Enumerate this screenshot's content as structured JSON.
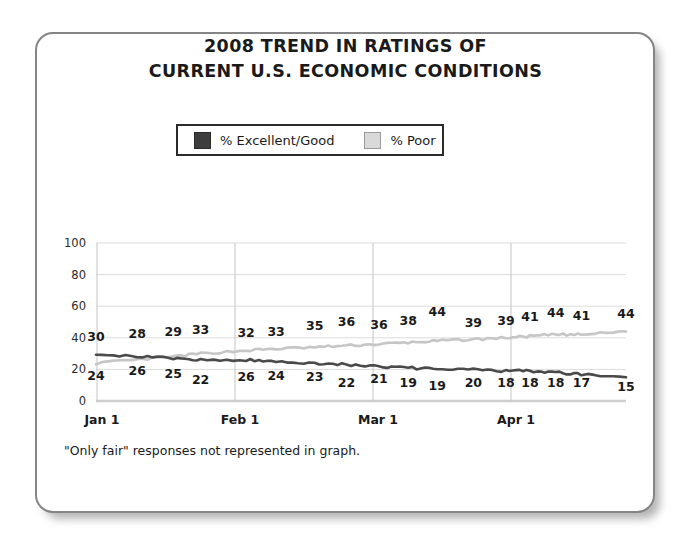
{
  "card": {
    "title_line1": "2008 TREND IN RATINGS OF",
    "title_line2": "CURRENT U.S. ECONOMIC CONDITIONS",
    "footnote": "\"Only fair\" responses not represented in graph."
  },
  "legend": {
    "entries": [
      {
        "label": "% Excellent/Good",
        "color": "#3d3d3d",
        "swatch": "dark"
      },
      {
        "label": "% Poor",
        "color": "#d9d9d9",
        "swatch": "light"
      }
    ]
  },
  "chart_data": {
    "type": "line",
    "title": "2008 TREND IN RATINGS OF CURRENT U.S. ECONOMIC CONDITIONS",
    "xlabel": "",
    "ylabel": "",
    "ylim": [
      0,
      100
    ],
    "yticks": [
      0,
      20,
      40,
      60,
      80,
      100
    ],
    "xticks": [
      "Jan 1",
      "Feb 1",
      "Mar 1",
      "Apr 1"
    ],
    "grid": true,
    "legend_position": "top-center",
    "note": "\"Only fair\" responses not represented in graph.",
    "series": [
      {
        "name": "% Excellent/Good",
        "color": "#4a4a4a",
        "values": [
          30,
          28,
          29,
          33,
          32,
          33,
          35,
          36,
          36,
          38,
          44,
          39,
          39,
          41,
          44,
          41,
          44
        ],
        "label_positions": [
          {
            "x": 30,
            "y": 30,
            "text": "30"
          },
          {
            "x": 78,
            "y": 28,
            "text": "28"
          },
          {
            "x": 120,
            "y": 29,
            "text": "29"
          },
          {
            "x": 152,
            "y": 33,
            "text": "33"
          },
          {
            "x": 205,
            "y": 32,
            "text": "32"
          },
          {
            "x": 240,
            "y": 33,
            "text": "33"
          },
          {
            "x": 285,
            "y": 35,
            "text": "35"
          },
          {
            "x": 322,
            "y": 36,
            "text": "36"
          },
          {
            "x": 360,
            "y": 36,
            "text": "36"
          },
          {
            "x": 394,
            "y": 38,
            "text": "38"
          },
          {
            "x": 428,
            "y": 44,
            "text": "44"
          },
          {
            "x": 470,
            "y": 39,
            "text": "39"
          },
          {
            "x": 508,
            "y": 39,
            "text": "39"
          },
          {
            "x": 536,
            "y": 41,
            "text": "41"
          },
          {
            "x": 566,
            "y": 44,
            "text": "44"
          },
          {
            "x": 596,
            "y": 41,
            "text": "41"
          },
          {
            "x": 648,
            "y": 44,
            "text": "44"
          }
        ]
      },
      {
        "name": "% Poor",
        "color": "#c6c6c6",
        "values": [
          24,
          26,
          25,
          22,
          26,
          24,
          23,
          22,
          21,
          19,
          19,
          20,
          18,
          18,
          18,
          17,
          15
        ],
        "label_positions": [
          {
            "x": 30,
            "y": 24,
            "text": "24"
          },
          {
            "x": 78,
            "y": 26,
            "text": "26"
          },
          {
            "x": 120,
            "y": 25,
            "text": "25"
          },
          {
            "x": 152,
            "y": 22,
            "text": "22"
          },
          {
            "x": 205,
            "y": 26,
            "text": "26"
          },
          {
            "x": 240,
            "y": 24,
            "text": "24"
          },
          {
            "x": 285,
            "y": 23,
            "text": "23"
          },
          {
            "x": 322,
            "y": 22,
            "text": "22"
          },
          {
            "x": 360,
            "y": 21,
            "text": "21"
          },
          {
            "x": 394,
            "y": 19,
            "text": "19"
          },
          {
            "x": 428,
            "y": 19,
            "text": "19"
          },
          {
            "x": 470,
            "y": 20,
            "text": "20"
          },
          {
            "x": 508,
            "y": 18,
            "text": "18"
          },
          {
            "x": 536,
            "y": 18,
            "text": "18"
          },
          {
            "x": 566,
            "y": 18,
            "text": "18"
          },
          {
            "x": 596,
            "y": 17,
            "text": "17"
          },
          {
            "x": 648,
            "y": 15,
            "text": "15"
          }
        ]
      }
    ],
    "upper_trace_labels": [
      "30",
      "28",
      "29",
      "33",
      "32",
      "33",
      "35",
      "36",
      "36",
      "38",
      "44",
      "39",
      "39",
      "41",
      "44",
      "41",
      "44"
    ],
    "lower_trace_labels": [
      "24",
      "26",
      "25",
      "22",
      "26",
      "24",
      "23",
      "22",
      "21",
      "19",
      "19",
      "20",
      "18",
      "18",
      "18",
      "17",
      "15"
    ]
  }
}
